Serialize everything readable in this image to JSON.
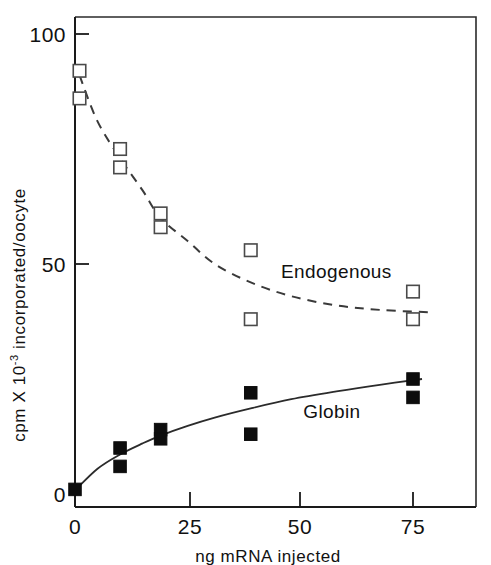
{
  "chart_data": {
    "type": "scatter",
    "title": "",
    "xlabel": "ng mRNA injected",
    "ylabel": "cpm X 10-3 incorporated/oocyte",
    "ylabel_parts": {
      "prefix": "cpm X 10",
      "exponent": "-3",
      "suffix": " incorporated/oocyte"
    },
    "xlim": [
      0,
      89
    ],
    "ylim": [
      0,
      104
    ],
    "xticks": [
      0,
      25,
      50,
      75
    ],
    "xtick_labels": [
      "0",
      "25",
      "50",
      "75"
    ],
    "yticks": [
      0,
      50,
      100
    ],
    "ytick_labels": [
      "0",
      "50",
      "100"
    ],
    "grid": false,
    "legend_position": "inline-annotations",
    "series": [
      {
        "name": "Endogenous",
        "marker": "open-square",
        "line_style": "dashed",
        "label_x": 58,
        "label_y": 47,
        "points": [
          {
            "x": 1,
            "y": 92
          },
          {
            "x": 1,
            "y": 86
          },
          {
            "x": 10,
            "y": 75
          },
          {
            "x": 10,
            "y": 71
          },
          {
            "x": 19,
            "y": 61
          },
          {
            "x": 19,
            "y": 58
          },
          {
            "x": 39,
            "y": 53
          },
          {
            "x": 39,
            "y": 38
          },
          {
            "x": 75,
            "y": 44
          },
          {
            "x": 75,
            "y": 38
          }
        ],
        "fit_curve": [
          {
            "x": 1,
            "y": 91
          },
          {
            "x": 5,
            "y": 81
          },
          {
            "x": 10,
            "y": 73
          },
          {
            "x": 15,
            "y": 66
          },
          {
            "x": 19,
            "y": 60
          },
          {
            "x": 25,
            "y": 55
          },
          {
            "x": 31,
            "y": 50
          },
          {
            "x": 39,
            "y": 46
          },
          {
            "x": 48,
            "y": 43
          },
          {
            "x": 58,
            "y": 41
          },
          {
            "x": 68,
            "y": 40
          },
          {
            "x": 79,
            "y": 39.5
          }
        ]
      },
      {
        "name": "Globin",
        "marker": "filled-square",
        "line_style": "solid",
        "label_x": 57,
        "label_y": 16.5,
        "points": [
          {
            "x": 0,
            "y": 1
          },
          {
            "x": 10,
            "y": 10
          },
          {
            "x": 10,
            "y": 6
          },
          {
            "x": 19,
            "y": 14
          },
          {
            "x": 19,
            "y": 12
          },
          {
            "x": 39,
            "y": 22
          },
          {
            "x": 39,
            "y": 13
          },
          {
            "x": 75,
            "y": 25
          },
          {
            "x": 75,
            "y": 21
          }
        ],
        "fit_curve": [
          {
            "x": 0,
            "y": 0.8
          },
          {
            "x": 5,
            "y": 5.5
          },
          {
            "x": 10,
            "y": 8.6
          },
          {
            "x": 15,
            "y": 11.0
          },
          {
            "x": 19,
            "y": 12.7
          },
          {
            "x": 25,
            "y": 14.8
          },
          {
            "x": 31,
            "y": 16.6
          },
          {
            "x": 39,
            "y": 18.6
          },
          {
            "x": 48,
            "y": 20.6
          },
          {
            "x": 58,
            "y": 22.3
          },
          {
            "x": 68,
            "y": 23.8
          },
          {
            "x": 77,
            "y": 25.0
          }
        ]
      }
    ]
  }
}
